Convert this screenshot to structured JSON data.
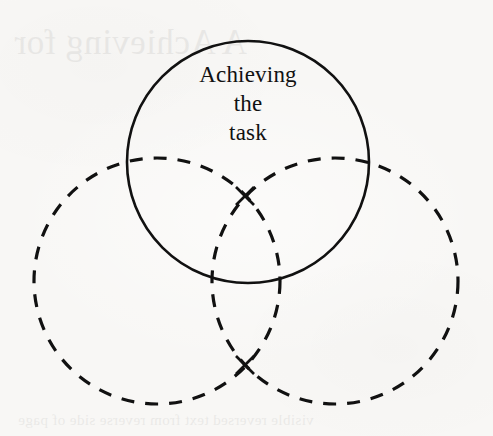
{
  "figure": {
    "type": "venn-diagram",
    "background_color": "#f8f7f5",
    "stroke_color": "#111111",
    "width": 493,
    "height": 436
  },
  "circles": [
    {
      "id": "top",
      "name": "achieving-the-task-circle",
      "style": "solid",
      "label_lines": [
        "Achieving",
        "the",
        "task"
      ],
      "label_full": "Achieving the task",
      "cx": 248,
      "cy": 162,
      "r": 121,
      "stroke_width": 2.6
    },
    {
      "id": "left",
      "name": "left-circle",
      "style": "dashed",
      "label_lines": [],
      "label_full": "",
      "cx": 157,
      "cy": 281,
      "r": 123,
      "stroke_width": 3.2
    },
    {
      "id": "right",
      "name": "right-circle",
      "style": "dashed",
      "label_lines": [],
      "label_full": "",
      "cx": 335,
      "cy": 281,
      "r": 123,
      "stroke_width": 3.2
    }
  ],
  "markers": [
    {
      "id": "upper-cross",
      "name": "upper-intersection-cross",
      "symbol": "x",
      "x": 245,
      "y": 196,
      "size": 9
    },
    {
      "id": "lower-cross",
      "name": "lower-intersection-cross",
      "symbol": "x",
      "x": 245,
      "y": 365,
      "size": 9
    }
  ],
  "bleed_through": {
    "top_text": "A  Achieving  for",
    "bottom_text": "visible reversed text from reverse side of page"
  },
  "label": {
    "line1": "Achieving",
    "line2": "the",
    "line3": "task"
  }
}
